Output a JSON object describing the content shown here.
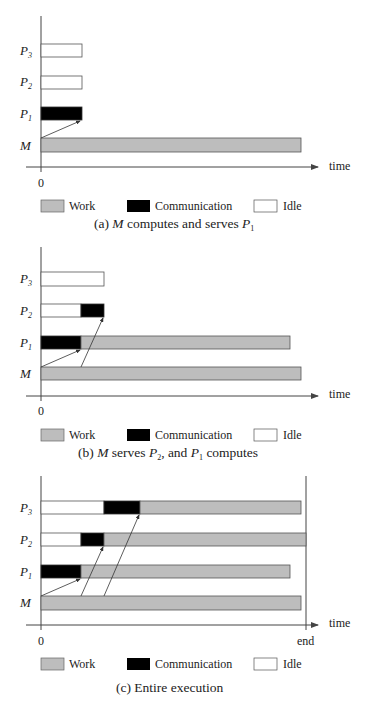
{
  "colors": {
    "work": "#bdbdbd",
    "communication": "#000000",
    "idle": "#ffffff",
    "axis": "#444444"
  },
  "legend": {
    "work": "Work",
    "communication": "Communication",
    "idle": "Idle"
  },
  "axis": {
    "time_label": "time",
    "zero_label": "0",
    "end_label": "end"
  },
  "rows": {
    "p3": "P",
    "p3_sub": "3",
    "p2": "P",
    "p2_sub": "2",
    "p1": "P",
    "p1_sub": "1",
    "m": "M"
  },
  "panels": [
    {
      "caption_prefix": "(a) ",
      "caption_m": "M",
      "caption_mid": " computes and serves ",
      "caption_p": "P",
      "caption_p_sub": "1",
      "bars": {
        "P3": [
          {
            "type": "idle",
            "start": 0,
            "end": 1
          }
        ],
        "P2": [
          {
            "type": "idle",
            "start": 0,
            "end": 1
          }
        ],
        "P1": [
          {
            "type": "communication",
            "start": 0,
            "end": 1
          }
        ],
        "M": [
          {
            "type": "work",
            "start": 0,
            "end": 6.5
          }
        ]
      }
    },
    {
      "caption_prefix": "(b) ",
      "caption_m": "M",
      "caption_mid": " serves ",
      "caption_p": "P",
      "caption_p_sub": "2",
      "caption_mid2": ", and ",
      "caption_p2": "P",
      "caption_p2_sub": "1",
      "caption_end": " computes",
      "bars": {
        "P3": [
          {
            "type": "idle",
            "start": 0,
            "end": 1.6
          }
        ],
        "P2": [
          {
            "type": "idle",
            "start": 0,
            "end": 1
          },
          {
            "type": "communication",
            "start": 1,
            "end": 1.6
          }
        ],
        "P1": [
          {
            "type": "communication",
            "start": 0,
            "end": 1
          },
          {
            "type": "work",
            "start": 1,
            "end": 6.2
          }
        ],
        "M": [
          {
            "type": "work",
            "start": 0,
            "end": 6.5
          }
        ]
      }
    },
    {
      "caption": "(c) Entire execution",
      "bars": {
        "P3": [
          {
            "type": "idle",
            "start": 0,
            "end": 1.6
          },
          {
            "type": "communication",
            "start": 1.6,
            "end": 2.5
          },
          {
            "type": "work",
            "start": 2.5,
            "end": 6.5
          }
        ],
        "P2": [
          {
            "type": "idle",
            "start": 0,
            "end": 1
          },
          {
            "type": "communication",
            "start": 1,
            "end": 1.6
          },
          {
            "type": "work",
            "start": 1.6,
            "end": 6.6
          }
        ],
        "P1": [
          {
            "type": "communication",
            "start": 0,
            "end": 1
          },
          {
            "type": "work",
            "start": 1,
            "end": 6.2
          }
        ],
        "M": [
          {
            "type": "work",
            "start": 0,
            "end": 6.5
          }
        ]
      }
    }
  ]
}
